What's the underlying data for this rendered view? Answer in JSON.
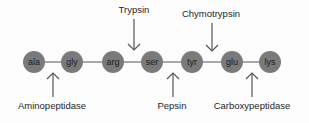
{
  "diagram": {
    "type": "peptide-cleavage-sites",
    "colors": {
      "residue_fill": "#7a7a7a",
      "bond_line": "#555555",
      "arrow": "#555555",
      "text": "#1f1f1f",
      "background": "#fdfdfd"
    },
    "chain_y": 62,
    "residue_radius": 11,
    "residues": [
      {
        "label": "ala",
        "x": 34
      },
      {
        "label": "gly",
        "x": 72
      },
      {
        "label": "arg",
        "x": 113
      },
      {
        "label": "ser",
        "x": 152
      },
      {
        "label": "tyr",
        "x": 192
      },
      {
        "label": "glu",
        "x": 232
      },
      {
        "label": "lys",
        "x": 270
      }
    ],
    "enzymes_top": [
      {
        "label": "Trypsin",
        "label_x": 134,
        "label_y": 13,
        "arrow_x": 134,
        "arrow_from_y": 19,
        "arrow_to_y": 50,
        "cleaves_between": [
          "arg",
          "ser"
        ]
      },
      {
        "label": "Chymotrypsin",
        "label_x": 211,
        "label_y": 17,
        "arrow_x": 212,
        "arrow_from_y": 23,
        "arrow_to_y": 51,
        "cleaves_between": [
          "tyr",
          "glu"
        ]
      }
    ],
    "enzymes_bottom": [
      {
        "label": "Aminopeptidase",
        "label_x": 52,
        "label_y": 109,
        "arrow_x": 53,
        "arrow_from_y": 97,
        "arrow_to_y": 73,
        "cleaves_between": [
          "ala",
          "gly"
        ]
      },
      {
        "label": "Pepsin",
        "label_x": 172,
        "label_y": 109,
        "arrow_x": 173,
        "arrow_from_y": 97,
        "arrow_to_y": 73,
        "cleaves_between": [
          "ser",
          "tyr"
        ]
      },
      {
        "label": "Carboxypeptidase",
        "label_x": 252,
        "label_y": 109,
        "arrow_x": 252,
        "arrow_from_y": 97,
        "arrow_to_y": 73,
        "cleaves_between": [
          "glu",
          "lys"
        ]
      }
    ]
  }
}
